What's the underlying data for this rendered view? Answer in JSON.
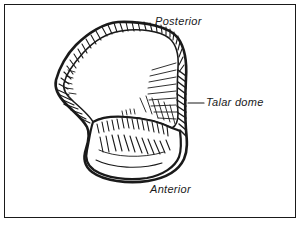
{
  "figure": {
    "type": "anatomical-line-drawing",
    "subject": "talar dome",
    "view": "superior view of the talus",
    "style": "pen-and-ink hatched illustration",
    "background_color": "#ffffff",
    "ink_color": "#1a1a1a",
    "border": {
      "name": "figure-border",
      "color": "#1a1a1a",
      "width_px": 1
    },
    "labels": {
      "posterior": "Posterior",
      "anterior": "Anterior",
      "talar_dome": "Talar dome"
    },
    "leader_lines": [
      {
        "name": "talar-dome-leader",
        "from_label": "Talar dome",
        "points_to": "right articular margin of the talar dome"
      }
    ]
  }
}
